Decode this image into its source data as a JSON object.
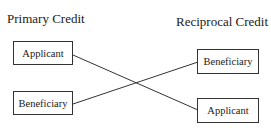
{
  "diagram": {
    "left_column": {
      "title": "Primary Credit",
      "boxes": [
        {
          "label": "Applicant"
        },
        {
          "label": "Beneficiary"
        }
      ]
    },
    "right_column": {
      "title": "Reciprocal Credit",
      "boxes": [
        {
          "label": "Beneficiary"
        },
        {
          "label": "Applicant"
        }
      ]
    },
    "connections": [
      {
        "from": "Primary Credit / Applicant",
        "to": "Reciprocal Credit / Applicant"
      },
      {
        "from": "Primary Credit / Beneficiary",
        "to": "Reciprocal Credit / Beneficiary"
      }
    ],
    "colors": {
      "line": "#333333",
      "text": "#1a1a1a",
      "background": "#ffffff"
    }
  }
}
